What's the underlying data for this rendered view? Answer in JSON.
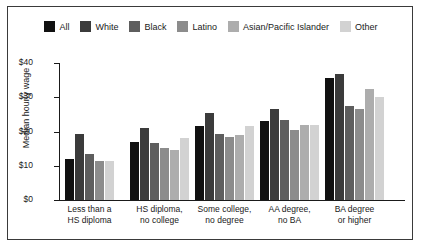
{
  "chart_data": {
    "type": "bar",
    "title": "",
    "xlabel": "",
    "ylabel": "Median hourly wage",
    "ylim": [
      0,
      40
    ],
    "ytick_labels": [
      "$40",
      "$30",
      "$20",
      "$10",
      "$0"
    ],
    "ytick_values": [
      40,
      30,
      20,
      10,
      0
    ],
    "grid": false,
    "legend_position": "top",
    "categories": [
      "Less than a\nHS diploma",
      "HS diploma,\nno college",
      "Some college,\nno degree",
      "AA degree,\nno BA",
      "BA degree\nor higher"
    ],
    "category_lines": [
      [
        "Less than a",
        "HS diploma"
      ],
      [
        "HS diploma,",
        "no college"
      ],
      [
        "Some college,",
        "no degree"
      ],
      [
        "AA degree,",
        "no BA"
      ],
      [
        "BA degree",
        "or higher"
      ]
    ],
    "series": [
      {
        "name": "All",
        "color": "#111111",
        "values": [
          12.0,
          17.0,
          21.5,
          23.0,
          35.5
        ]
      },
      {
        "name": "White",
        "color": "#3b3b3b",
        "values": [
          19.2,
          21.0,
          25.5,
          26.5,
          36.8
        ]
      },
      {
        "name": "Black",
        "color": "#5e5e5e",
        "values": [
          13.3,
          16.7,
          19.3,
          23.3,
          27.5
        ]
      },
      {
        "name": "Latino",
        "color": "#8c8c8c",
        "values": [
          11.3,
          15.2,
          18.5,
          20.3,
          26.5
        ]
      },
      {
        "name": "Asian/Pacific Islander",
        "color": "#adadad",
        "values": [
          null,
          14.7,
          19.0,
          22.0,
          32.5
        ]
      },
      {
        "name": "Other",
        "color": "#d2d2d2",
        "values": [
          11.5,
          18.0,
          21.5,
          21.8,
          30.0
        ]
      }
    ]
  }
}
